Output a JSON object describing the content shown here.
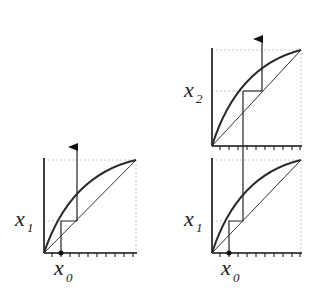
{
  "diagram": {
    "panels": [
      {
        "id": "left",
        "y_label": "x",
        "y_sub": "1",
        "x_label": "x",
        "x_sub": "0"
      },
      {
        "id": "top-right",
        "y_label": "x",
        "y_sub": "2"
      },
      {
        "id": "bottom-right",
        "y_label": "x",
        "y_sub": "1",
        "x_label": "x",
        "x_sub": "0"
      }
    ],
    "colors": {
      "curve": "#2a2a2a",
      "line": "#333333",
      "guide": "#bbbbbb"
    }
  }
}
